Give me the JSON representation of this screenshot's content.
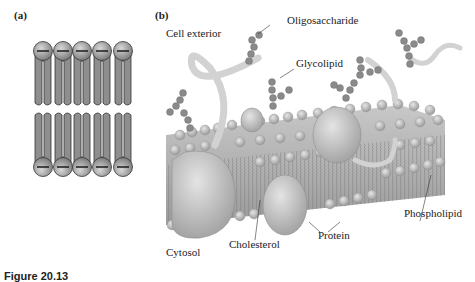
{
  "figure": {
    "caption": "Figure 20.13",
    "panel_a": {
      "label": "(a)",
      "description": "Bilayer schematic: 5 phospholipids per leaflet, heads facing outward, tails inward",
      "molecules_per_leaflet": 5,
      "colors": {
        "head": "#9a9a9a",
        "tail": "#8e8e8e",
        "outline": "#333333"
      }
    },
    "panel_b": {
      "label": "(b)",
      "labels": {
        "cell_exterior": "Cell exterior",
        "oligosaccharide": "Oligosaccharide",
        "glycolipid": "Glycolipid",
        "phospholipid": "Phospholipid",
        "protein": "Protein",
        "cholesterol": "Cholesterol",
        "cytosol": "Cytosol"
      },
      "colors": {
        "membrane": "#b9b9b9",
        "bead": "#8a8a8a",
        "protein": "#c4c4c4",
        "ribbon": "#d6d6d6"
      }
    }
  }
}
